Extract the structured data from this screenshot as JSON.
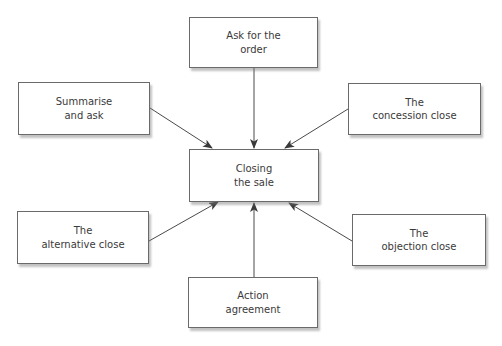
{
  "diagram": {
    "type": "hub-and-spoke",
    "center": {
      "id": "closing",
      "lines": [
        "Closing",
        "the sale"
      ],
      "box": {
        "x": 189,
        "y": 149,
        "w": 130,
        "h": 53
      }
    },
    "nodes": [
      {
        "id": "ask",
        "lines": [
          "Ask for the",
          "order"
        ],
        "box": {
          "x": 189,
          "y": 17,
          "w": 129,
          "h": 51
        }
      },
      {
        "id": "summarise",
        "lines": [
          "Summarise",
          "and ask"
        ],
        "box": {
          "x": 18,
          "y": 82,
          "w": 132,
          "h": 53
        }
      },
      {
        "id": "concession",
        "lines": [
          "The",
          "concession close"
        ],
        "box": {
          "x": 348,
          "y": 83,
          "w": 133,
          "h": 52
        }
      },
      {
        "id": "alternative",
        "lines": [
          "The",
          "alternative close"
        ],
        "box": {
          "x": 17,
          "y": 211,
          "w": 132,
          "h": 53
        }
      },
      {
        "id": "objection",
        "lines": [
          "The",
          "objection close"
        ],
        "box": {
          "x": 352,
          "y": 214,
          "w": 134,
          "h": 52
        }
      },
      {
        "id": "action",
        "lines": [
          "Action",
          "agreement"
        ],
        "box": {
          "x": 188,
          "y": 277,
          "w": 130,
          "h": 51
        }
      }
    ],
    "edges": [
      {
        "from": "ask",
        "to": "closing",
        "x1": 254,
        "y1": 68,
        "x2": 254,
        "y2": 148
      },
      {
        "from": "summarise",
        "to": "closing",
        "x1": 150,
        "y1": 108,
        "x2": 212,
        "y2": 148
      },
      {
        "from": "concession",
        "to": "closing",
        "x1": 348,
        "y1": 109,
        "x2": 285,
        "y2": 148
      },
      {
        "from": "alternative",
        "to": "closing",
        "x1": 149,
        "y1": 241,
        "x2": 218,
        "y2": 202
      },
      {
        "from": "action",
        "to": "closing",
        "x1": 254,
        "y1": 277,
        "x2": 254,
        "y2": 203
      },
      {
        "from": "objection",
        "to": "closing",
        "x1": 352,
        "y1": 241,
        "x2": 289,
        "y2": 203
      }
    ],
    "colors": {
      "border": "#6a6a6a",
      "line": "#4a4a4a",
      "text": "#3a3a3a",
      "background": "#ffffff"
    }
  }
}
